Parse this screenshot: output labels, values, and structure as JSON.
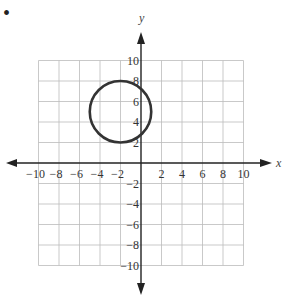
{
  "bullet": "•",
  "chart_data": {
    "type": "scatter",
    "title": "",
    "xlabel": "x",
    "ylabel": "y",
    "xlim": [
      -10,
      10
    ],
    "ylim": [
      -10,
      10
    ],
    "grid": true,
    "grid_step": 2,
    "x_ticks": [
      -10,
      -8,
      -6,
      -4,
      -2,
      2,
      4,
      6,
      8,
      10
    ],
    "y_ticks": [
      10,
      8,
      6,
      4,
      2,
      -2,
      -4,
      -6,
      -8,
      -10
    ],
    "shapes": [
      {
        "shape": "circle",
        "center": [
          -2,
          5
        ],
        "radius": 3,
        "color": "#333333"
      }
    ]
  },
  "labels": {
    "x_axis": "x",
    "y_axis": "y",
    "xt": [
      "−10",
      "−8",
      "−6",
      "−4",
      "−2",
      "2",
      "4",
      "6",
      "8",
      "10"
    ],
    "yt": [
      "10",
      "8",
      "6",
      "4",
      "2",
      "−2",
      "−4",
      "−6",
      "−8",
      "−10"
    ]
  }
}
